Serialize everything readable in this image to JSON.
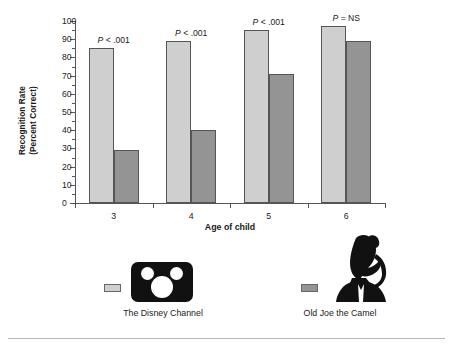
{
  "chart_data": {
    "type": "bar",
    "title": "",
    "xlabel": "Age of child",
    "ylabel": "Recognition Rate (Percent Correct)",
    "ylabel_line1": "Recognition Rate",
    "ylabel_line2": "(Percent Correct)",
    "categories": [
      "3",
      "4",
      "5",
      "6"
    ],
    "ylim": [
      0,
      100
    ],
    "yticks": [
      0,
      10,
      20,
      30,
      40,
      50,
      60,
      70,
      80,
      90,
      100
    ],
    "ytick_labels": [
      "0",
      "10",
      "20",
      "30",
      "40",
      "50",
      "60",
      "70",
      "80",
      "90",
      "100"
    ],
    "grid": false,
    "legend_position": "below-plot",
    "series": [
      {
        "name": "The Disney Channel",
        "color": "#cfcfcf",
        "values": [
          85,
          89,
          95,
          97
        ]
      },
      {
        "name": "Old Joe the Camel",
        "color": "#949494",
        "values": [
          29,
          40,
          71,
          89
        ]
      }
    ],
    "annotations": [
      {
        "category": "3",
        "text": "P < .001",
        "symbol": "P",
        "operator": "<",
        "value": ".001"
      },
      {
        "category": "4",
        "text": "P < .001",
        "symbol": "P",
        "operator": "<",
        "value": ".001"
      },
      {
        "category": "5",
        "text": "P < .001",
        "symbol": "P",
        "operator": "<",
        "value": ".001"
      },
      {
        "category": "6",
        "text": "P = NS",
        "symbol": "P",
        "operator": "=",
        "value": "NS"
      }
    ]
  },
  "legend": {
    "entries": [
      {
        "label": "The Disney Channel",
        "color": "#cfcfcf",
        "icon": "mickey-mouse-logo"
      },
      {
        "label": "Old Joe the Camel",
        "color": "#949494",
        "icon": "camel-silhouette-logo"
      }
    ]
  },
  "annotations_text": {
    "a0_p": "P",
    "a0_rest": "< .001",
    "a1_p": "P",
    "a1_rest": "< .001",
    "a2_p": "P",
    "a2_rest": "< .001",
    "a3_p": "P",
    "a3_rest": "= NS"
  }
}
